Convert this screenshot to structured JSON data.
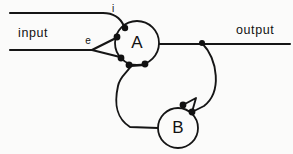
{
  "figure": {
    "type": "circuit-diagram",
    "background_color": "#fbfbfa",
    "line_color": "#151515",
    "width": 293,
    "height": 154
  },
  "nodes": [
    {
      "id": "A",
      "label": "A",
      "cx": 137,
      "cy": 43,
      "r": 22
    },
    {
      "id": "B",
      "label": "B",
      "cx": 178,
      "cy": 128,
      "r": 20
    }
  ],
  "labels": {
    "input": "input",
    "output": "output",
    "inhibitory_port": "i",
    "excitatory_port": "e"
  },
  "lines": {
    "input_top": "M10,13 L103,13 Q118,13 124,26",
    "input_bottom": "M10,50 L92,50",
    "branch_upper": "M92,50 L116,38",
    "branch_lower": "M92,50 L120,57",
    "output": "M159,44 L290,44",
    "feedback_right": "M202,43 C218,60 222,92 204,106 L192,112",
    "feedback_left_stem": "M131,66 C126,74 120,76 118,86 C114,104 116,118 130,127 L158,128",
    "feedback_left_branch": "M131,66 L145,65",
    "b_hook": "M183,105 L196,98 L192,112"
  },
  "synapse_dots": [
    {
      "name": "inhibitory-terminal-top",
      "cx": 125,
      "cy": 28,
      "r": 3.2
    },
    {
      "name": "excitatory-terminal-upper",
      "cx": 117,
      "cy": 37,
      "r": 3.4
    },
    {
      "name": "excitatory-terminal-lower",
      "cx": 121,
      "cy": 58,
      "r": 3.4
    },
    {
      "name": "a-output-terminal-left",
      "cx": 129,
      "cy": 65,
      "r": 3.4
    },
    {
      "name": "a-output-terminal-right",
      "cx": 145,
      "cy": 64,
      "r": 3.4
    },
    {
      "name": "b-input-terminal",
      "cx": 183,
      "cy": 105,
      "r": 3.4
    },
    {
      "name": "b-feedback-terminal",
      "cx": 192,
      "cy": 112,
      "r": 3.4
    },
    {
      "name": "output-junction",
      "cx": 202,
      "cy": 43,
      "r": 3.0
    }
  ],
  "text_positions": {
    "input": {
      "x": 18,
      "y": 37
    },
    "output": {
      "x": 236,
      "y": 34
    },
    "i": {
      "x": 113,
      "y": 11
    },
    "e": {
      "x": 88,
      "y": 43
    }
  }
}
